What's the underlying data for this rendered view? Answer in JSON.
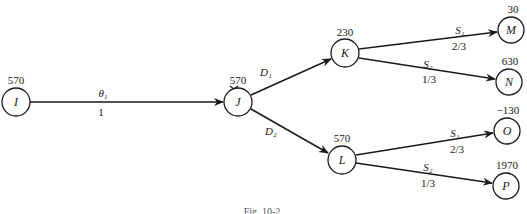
{
  "diagram": {
    "type": "decision-tree",
    "caption": "Fig. 10-2",
    "nodes": [
      {
        "id": "I",
        "value": "570"
      },
      {
        "id": "J",
        "value": "570"
      },
      {
        "id": "K",
        "value": "230"
      },
      {
        "id": "L",
        "value": "570"
      },
      {
        "id": "M",
        "value": "30"
      },
      {
        "id": "N",
        "value": "630"
      },
      {
        "id": "O",
        "value": "−130"
      },
      {
        "id": "P",
        "value": "1970"
      }
    ],
    "edges": [
      {
        "from": "I",
        "to": "J",
        "label": "θ₁",
        "prob": "1"
      },
      {
        "from": "J",
        "to": "K",
        "label": "D₁",
        "prob": "",
        "pruned": true
      },
      {
        "from": "J",
        "to": "L",
        "label": "D₂",
        "prob": ""
      },
      {
        "from": "K",
        "to": "M",
        "label": "S₁",
        "prob": "2/3"
      },
      {
        "from": "K",
        "to": "N",
        "label": "S₂",
        "prob": "1/3"
      },
      {
        "from": "L",
        "to": "O",
        "label": "S₁",
        "prob": "2/3"
      },
      {
        "from": "L",
        "to": "P",
        "label": "S₂",
        "prob": "1/3"
      }
    ]
  }
}
